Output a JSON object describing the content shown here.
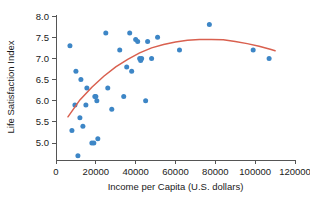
{
  "chart_data": {
    "type": "scatter",
    "title": "",
    "xlabel": "Income per Capita (U.S. dollars)",
    "ylabel": "Life Satisfaction Index",
    "xlim": [
      0,
      120000
    ],
    "ylim": [
      4.6,
      8.05
    ],
    "grid": false,
    "legend": null,
    "xticks": [
      0,
      20000,
      40000,
      60000,
      80000,
      100000,
      120000
    ],
    "xtick_labels": [
      "0",
      "20000",
      "40000",
      "60000",
      "80000",
      "100000",
      "120000"
    ],
    "yticks": [
      5.0,
      5.5,
      6.0,
      6.5,
      7.0,
      7.5,
      8.0
    ],
    "ytick_labels": [
      "5.0",
      "5.5",
      "6.0",
      "6.5",
      "7.0",
      "7.5",
      "8.0"
    ],
    "point_color": "#3d86c6",
    "curve_color": "#d9604f",
    "axis_color": "#555555",
    "points": [
      [
        7000,
        7.3
      ],
      [
        8000,
        5.3
      ],
      [
        9500,
        5.9
      ],
      [
        10000,
        6.7
      ],
      [
        11000,
        4.7
      ],
      [
        12000,
        5.6
      ],
      [
        12500,
        6.5
      ],
      [
        13500,
        5.4
      ],
      [
        15000,
        5.9
      ],
      [
        15500,
        6.3
      ],
      [
        18000,
        5.0
      ],
      [
        19000,
        5.0
      ],
      [
        19500,
        6.1
      ],
      [
        20000,
        6.1
      ],
      [
        20500,
        6.0
      ],
      [
        21000,
        5.1
      ],
      [
        25000,
        7.6
      ],
      [
        26000,
        6.3
      ],
      [
        28000,
        5.8
      ],
      [
        32000,
        7.2
      ],
      [
        34000,
        6.1
      ],
      [
        35500,
        6.8
      ],
      [
        37000,
        7.6
      ],
      [
        38000,
        6.7
      ],
      [
        40000,
        7.45
      ],
      [
        41000,
        7.4
      ],
      [
        42000,
        7.0
      ],
      [
        42500,
        6.95
      ],
      [
        43000,
        7.0
      ],
      [
        45000,
        6.0
      ],
      [
        46000,
        7.4
      ],
      [
        48000,
        7.0
      ],
      [
        51000,
        7.5
      ],
      [
        62000,
        7.2
      ],
      [
        77000,
        7.8
      ],
      [
        99000,
        7.2
      ],
      [
        107000,
        7.0
      ]
    ],
    "curve": {
      "type": "quadratic-fit",
      "description": "Quadratic regression curve rising from about 5.6 at 6000 dollars, peaking near 7.45 around 80000 dollars, then declining to about 7.2 at 110000 dollars",
      "points": [
        [
          6000,
          5.62
        ],
        [
          12000,
          6.02
        ],
        [
          18000,
          6.32
        ],
        [
          24000,
          6.58
        ],
        [
          30000,
          6.8
        ],
        [
          36000,
          6.98
        ],
        [
          42000,
          7.13
        ],
        [
          48000,
          7.25
        ],
        [
          54000,
          7.33
        ],
        [
          60000,
          7.39
        ],
        [
          66000,
          7.43
        ],
        [
          72000,
          7.45
        ],
        [
          78000,
          7.45
        ],
        [
          84000,
          7.44
        ],
        [
          90000,
          7.4
        ],
        [
          96000,
          7.35
        ],
        [
          102000,
          7.29
        ],
        [
          108000,
          7.21
        ],
        [
          110000,
          7.18
        ]
      ]
    }
  }
}
